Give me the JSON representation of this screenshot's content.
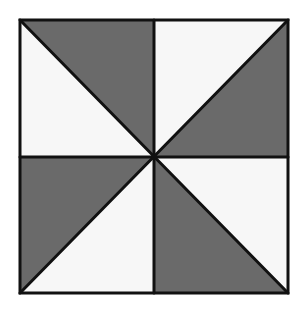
{
  "diagram": {
    "colors": {
      "shaded": "#6a6a6a",
      "unshaded": "#f7f7f7",
      "stroke": "#111111",
      "background": "#ffffff"
    },
    "square": {
      "left": 20,
      "top": 20,
      "right": 288,
      "bottom": 293
    },
    "center": {
      "x": 154,
      "y": 157
    },
    "triangles": [
      {
        "quadrant": "top-left",
        "shade": "unshaded"
      },
      {
        "quadrant": "top-left",
        "shade": "shaded"
      },
      {
        "quadrant": "top-right",
        "shade": "unshaded"
      },
      {
        "quadrant": "top-right",
        "shade": "shaded"
      },
      {
        "quadrant": "bottom-left",
        "shade": "shaded"
      },
      {
        "quadrant": "bottom-left",
        "shade": "unshaded"
      },
      {
        "quadrant": "bottom-right",
        "shade": "shaded"
      },
      {
        "quadrant": "bottom-right",
        "shade": "unshaded"
      }
    ]
  }
}
